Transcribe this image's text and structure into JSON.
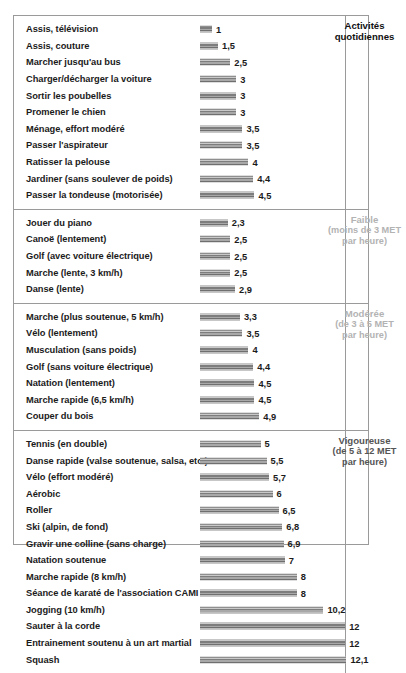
{
  "chart_data": {
    "type": "bar",
    "title": "",
    "xlabel": "MET par heure",
    "ylabel": "",
    "xlim": [
      0,
      12.1
    ],
    "grid": false,
    "legend": "none",
    "orientation": "horizontal",
    "unit": "MET",
    "scale_px_per_unit": 12.1,
    "groups": [
      {
        "caption_title": "Activités",
        "caption_title2": "quotidiennes",
        "caption_sub": "",
        "tone": "tone-dark",
        "categories": [
          "Assis, télévision",
          "Assis, couture",
          "Marcher jusqu'au bus",
          "Charger/décharger la voiture",
          "Sortir les poubelles",
          "Promener le chien",
          "Ménage, effort modéré",
          "Passer l'aspirateur",
          "Ratisser la pelouse",
          "Jardiner (sans soulever de poids)",
          "Passer la tondeuse (motorisée)"
        ],
        "values": [
          1,
          1.5,
          2.5,
          3,
          3,
          3,
          3.5,
          3.5,
          4,
          4.4,
          4.5
        ],
        "value_labels": [
          "1",
          "1,5",
          "2,5",
          "3",
          "3",
          "3",
          "3,5",
          "3,5",
          "4",
          "4,4",
          "4,5"
        ]
      },
      {
        "caption_title": "Faible",
        "caption_title2": "",
        "caption_sub": "(moins de 3 MET\npar heure)",
        "tone": "tone-gray",
        "categories": [
          "Jouer du piano",
          "Canoë (lentement)",
          "Golf (avec voiture électrique)",
          "Marche (lente, 3 km/h)",
          "Danse (lente)"
        ],
        "values": [
          2.3,
          2.5,
          2.5,
          2.5,
          2.9
        ],
        "value_labels": [
          "2,3",
          "2,5",
          "2,5",
          "2,5",
          "2,9"
        ]
      },
      {
        "caption_title": "Modérée",
        "caption_title2": "",
        "caption_sub": "(de 3 à 5 MET\npar heure)",
        "tone": "tone-gray",
        "categories": [
          "Marche (plus soutenue, 5 km/h)",
          "Vélo (lentement)",
          "Musculation  (sans poids)",
          "Golf (sans voiture électrique)",
          "Natation (lentement)",
          "Marche rapide (6,5 km/h)",
          "Couper du bois"
        ],
        "values": [
          3.3,
          3.5,
          4,
          4.4,
          4.5,
          4.5,
          4.9
        ],
        "value_labels": [
          "3,3",
          "3,5",
          "4",
          "4,4",
          "4,5",
          "4,5",
          "4,9"
        ]
      },
      {
        "caption_title": "Vigoureuse",
        "caption_title2": "",
        "caption_sub": "(de 5 à 12 MET\npar heure)",
        "tone": "tone-mid",
        "categories": [
          "Tennis (en double)",
          "Danse rapide (valse soutenue, salsa, etc.)",
          "Vélo (effort modéré)",
          "Aérobic",
          "Roller",
          "Ski (alpin, de fond)",
          "Gravir une colline (sans charge)",
          "Natation soutenue",
          "Marche rapide (8 km/h)",
          "Séance de karaté de l'association CAMI",
          "Jogging (10 km/h)",
          "Sauter à la corde",
          "Entrainement soutenu à un art martial",
          "Squash"
        ],
        "values": [
          5,
          5.5,
          5.7,
          6,
          6.5,
          6.8,
          6.9,
          7,
          8,
          8,
          10.2,
          12,
          12,
          12.1
        ],
        "value_labels": [
          "5",
          "5,5",
          "5,7",
          "6",
          "6,5",
          "6,8",
          "6,9",
          "7",
          "8",
          "8",
          "10,2",
          "12",
          "12",
          "12,1"
        ]
      }
    ]
  }
}
